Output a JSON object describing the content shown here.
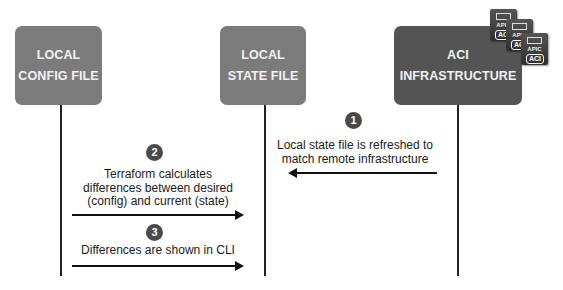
{
  "boxes": [
    {
      "id": "local-config",
      "line1": "LOCAL",
      "line2": "CONFIG FILE"
    },
    {
      "id": "local-state",
      "line1": "LOCAL",
      "line2": "STATE FILE"
    },
    {
      "id": "aci-infra",
      "line1": "ACI",
      "line2": "INFRASTRUCTURE"
    }
  ],
  "servers": [
    {
      "tag": "APIC",
      "badge": "ACI"
    },
    {
      "tag": "APIC",
      "badge": "ACI"
    },
    {
      "tag": "APIC",
      "badge": "ACI"
    }
  ],
  "steps": [
    {
      "number": "1",
      "lines": [
        "Local state file is refreshed to",
        "match remote infrastructure"
      ],
      "direction": "left"
    },
    {
      "number": "2",
      "lines": [
        "Terraform calculates",
        "differences between desired",
        "(config) and current (state)"
      ],
      "direction": "right"
    },
    {
      "number": "3",
      "lines": [
        "Differences are shown in CLI"
      ],
      "direction": "right"
    }
  ]
}
